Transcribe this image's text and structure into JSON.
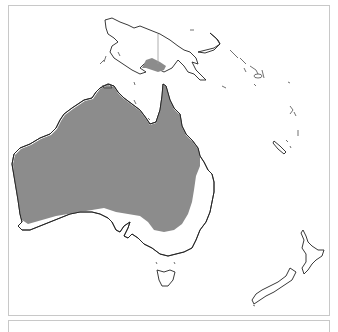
{
  "map": {
    "type": "species-range-map",
    "region": "Australasia",
    "visible_landmasses": [
      "Australia",
      "New Guinea",
      "Tasmania",
      "New Zealand",
      "New Caledonia",
      "Solomon Islands",
      "Vanuatu"
    ],
    "range_color": "#8c8c8c",
    "land_color": "#ffffff",
    "coast_color": "#222222",
    "frame_color": "#c8c8c8",
    "range_description": "Shaded range covers most of mainland Australia except the southern coastal strip and eastern coastal strip, plus a small area of southern New Guinea"
  }
}
